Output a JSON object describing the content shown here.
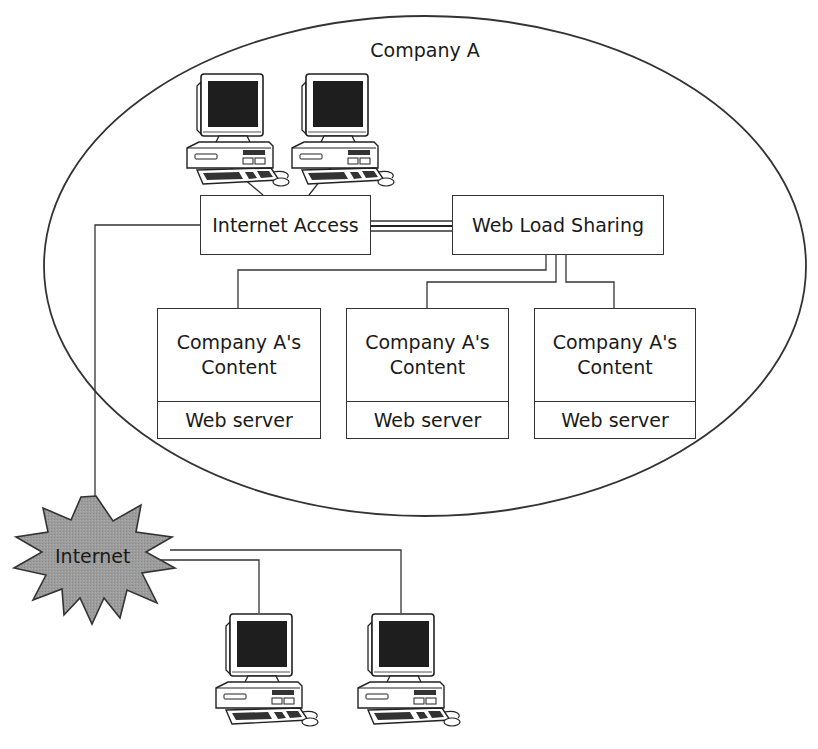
{
  "diagram": {
    "boundary": {
      "label": "Company A"
    },
    "internet_access": {
      "label": "Internet Access"
    },
    "load_sharing": {
      "label": "Web Load Sharing"
    },
    "servers": [
      {
        "content_line1": "Company A's",
        "content_line2": "Content",
        "role": "Web server"
      },
      {
        "content_line1": "Company A's",
        "content_line2": "Content",
        "role": "Web server"
      },
      {
        "content_line1": "Company A's",
        "content_line2": "Content",
        "role": "Web server"
      }
    ],
    "internet": {
      "label": "Internet",
      "fill": "#9a9a9a"
    },
    "internal_clients": [
      {
        "icon": "desktop-computer-icon"
      },
      {
        "icon": "desktop-computer-icon"
      }
    ],
    "external_clients": [
      {
        "icon": "desktop-computer-icon"
      },
      {
        "icon": "desktop-computer-icon"
      }
    ],
    "colors": {
      "line": "#333333",
      "screen": "#1e1e1e",
      "background": "#ffffff"
    }
  }
}
